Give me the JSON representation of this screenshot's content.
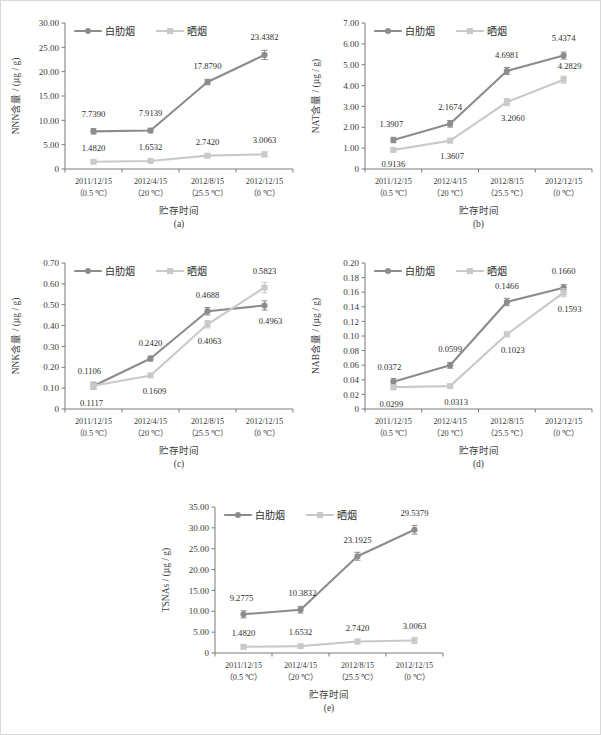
{
  "figure": {
    "series_names": [
      "白肋烟",
      "晒烟"
    ],
    "series_colors": [
      "#8c8c8c",
      "#c9c9c9"
    ],
    "x_axis_title": "贮存时间",
    "x_categories": [
      {
        "date": "2011/12/15",
        "temp": "（0.5 ℃）"
      },
      {
        "date": "2012/4/15",
        "temp": "（20 ℃）"
      },
      {
        "date": "2012/8/15",
        "temp": "（25.5 ℃）"
      },
      {
        "date": "2012/12/15",
        "temp": "（0 ℃）"
      }
    ]
  },
  "chart_data": [
    {
      "type": "line",
      "panel": "(a)",
      "title": "",
      "ylabel": "NNN含量 / (µg / g)",
      "xlabel": "贮存时间",
      "ylim": [
        0,
        30
      ],
      "yticks": [
        "0",
        "5.00",
        "10.00",
        "15.00",
        "20.00",
        "25.00",
        "30.00"
      ],
      "ytick_values": [
        0,
        5,
        10,
        15,
        20,
        25,
        30
      ],
      "grid": false,
      "legend": [
        "白肋烟",
        "晒烟"
      ],
      "legend_position": "top-inside",
      "categories": [
        "2011/12/15（0.5 ℃）",
        "2012/4/15（20 ℃）",
        "2012/8/15（25.5 ℃）",
        "2012/12/15（0 ℃）"
      ],
      "series": [
        {
          "name": "白肋烟",
          "values": [
            7.739,
            7.9139,
            17.879,
            23.4382
          ],
          "errors": [
            0.55,
            0.45,
            0.55,
            0.95
          ],
          "labels": [
            "7.7390",
            "7.9139",
            "17.8790",
            "23.4382"
          ]
        },
        {
          "name": "晒烟",
          "values": [
            1.482,
            1.6532,
            2.742,
            3.0063
          ],
          "errors": [
            0.25,
            0.25,
            0.4,
            0.5
          ],
          "labels": [
            "1.4820",
            "1.6532",
            "2.7420",
            "3.0063"
          ]
        }
      ]
    },
    {
      "type": "line",
      "panel": "(b)",
      "title": "",
      "ylabel": "NAT含量 / (µg / g)",
      "xlabel": "贮存时间",
      "ylim": [
        0,
        7
      ],
      "yticks": [
        "0",
        "1.00",
        "2.00",
        "3.00",
        "4.00",
        "5.00",
        "6.00",
        "7.00"
      ],
      "ytick_values": [
        0,
        1,
        2,
        3,
        4,
        5,
        6,
        7
      ],
      "grid": false,
      "legend": [
        "白肋烟",
        "晒烟"
      ],
      "legend_position": "top-inside",
      "categories": [
        "2011/12/15（0.5 ℃）",
        "2012/4/15（20 ℃）",
        "2012/8/15（25.5 ℃）",
        "2012/12/15（0 ℃）"
      ],
      "series": [
        {
          "name": "白肋烟",
          "values": [
            1.3907,
            2.1674,
            4.6981,
            5.4374
          ],
          "errors": [
            0.13,
            0.16,
            0.17,
            0.17
          ],
          "labels": [
            "1.3907",
            "2.1674",
            "4.6981",
            "5.4374"
          ]
        },
        {
          "name": "晒烟",
          "values": [
            0.9136,
            1.3607,
            3.206,
            4.2829
          ],
          "errors": [
            0.08,
            0.1,
            0.17,
            0.17
          ],
          "labels": [
            "0.9136",
            "1.3607",
            "3.2060",
            "4.2829"
          ]
        }
      ]
    },
    {
      "type": "line",
      "panel": "(c)",
      "title": "",
      "ylabel": "NNK含量 / (µg / g)",
      "xlabel": "贮存时间",
      "ylim": [
        0,
        0.7
      ],
      "yticks": [
        "0",
        "0.10",
        "0.20",
        "0.30",
        "0.40",
        "0.50",
        "0.60",
        "0.70"
      ],
      "ytick_values": [
        0,
        0.1,
        0.2,
        0.3,
        0.4,
        0.5,
        0.6,
        0.7
      ],
      "grid": false,
      "legend": [
        "白肋烟",
        "晒烟"
      ],
      "legend_position": "top-inside",
      "categories": [
        "2011/12/15（0.5 ℃）",
        "2012/4/15（20 ℃）",
        "2012/8/15（25.5 ℃）",
        "2012/12/15（0 ℃）"
      ],
      "series": [
        {
          "name": "白肋烟",
          "values": [
            0.1106,
            0.242,
            0.4688,
            0.4963
          ],
          "errors": [
            0.017,
            0.012,
            0.018,
            0.022
          ],
          "labels": [
            "0.1106",
            "0.2420",
            "0.4688",
            "0.4963"
          ]
        },
        {
          "name": "晒烟",
          "values": [
            0.1117,
            0.1609,
            0.4063,
            0.5823
          ],
          "errors": [
            0.018,
            0.01,
            0.018,
            0.025
          ],
          "labels": [
            "0.1117",
            "0.1609",
            "0.4063",
            "0.5823"
          ]
        }
      ]
    },
    {
      "type": "line",
      "panel": "(d)",
      "title": "",
      "ylabel": "NAB含量 / (µg / g)",
      "xlabel": "贮存时间",
      "ylim": [
        0,
        0.2
      ],
      "yticks": [
        "0",
        "0.02",
        "0.04",
        "0.06",
        "0.08",
        "0.10",
        "0.12",
        "0.14",
        "0.16",
        "0.18",
        "0.20"
      ],
      "ytick_values": [
        0,
        0.02,
        0.04,
        0.06,
        0.08,
        0.1,
        0.12,
        0.14,
        0.16,
        0.18,
        0.2
      ],
      "grid": false,
      "legend": [
        "白肋烟",
        "晒烟"
      ],
      "legend_position": "top-inside",
      "categories": [
        "2011/12/15（0.5 ℃）",
        "2012/4/15（20 ℃）",
        "2012/8/15（25.5 ℃）",
        "2012/12/15（0 ℃）"
      ],
      "series": [
        {
          "name": "白肋烟",
          "values": [
            0.0372,
            0.0599,
            0.1466,
            0.166
          ],
          "errors": [
            0.0045,
            0.004,
            0.005,
            0.0045
          ],
          "labels": [
            "0.0372",
            "0.0599",
            "0.1466",
            "0.1660"
          ]
        },
        {
          "name": "晒烟",
          "values": [
            0.0299,
            0.0313,
            0.1023,
            0.1593
          ],
          "errors": [
            0.0035,
            0.003,
            0.003,
            0.0055
          ],
          "labels": [
            "0.0299",
            "0.0313",
            "0.1023",
            "0.1593"
          ]
        }
      ]
    },
    {
      "type": "line",
      "panel": "(e)",
      "title": "",
      "ylabel": "TSNAs / (µg / g)",
      "xlabel": "贮存时间",
      "ylim": [
        0,
        35
      ],
      "yticks": [
        "0",
        "5.00",
        "10.00",
        "15.00",
        "20.00",
        "25.00",
        "30.00",
        "35.00"
      ],
      "ytick_values": [
        0,
        5,
        10,
        15,
        20,
        25,
        30,
        35
      ],
      "grid": false,
      "legend": [
        "白肋烟",
        "晒烟"
      ],
      "legend_position": "top-inside",
      "categories": [
        "2011/12/15（0.5 ℃）",
        "2012/4/15（20 ℃）",
        "2012/8/15（25.5 ℃）",
        "2012/12/15（0 ℃）"
      ],
      "series": [
        {
          "name": "白肋烟",
          "values": [
            9.2775,
            10.3832,
            23.1925,
            29.5379
          ],
          "errors": [
            0.85,
            0.8,
            0.95,
            1.05
          ],
          "labels": [
            "9.2775",
            "10.3832",
            "23.1925",
            "29.5379"
          ]
        },
        {
          "name": "晒烟",
          "values": [
            1.482,
            1.6532,
            2.742,
            3.0063
          ],
          "errors": [
            0.45,
            0.4,
            0.55,
            0.75
          ],
          "labels": [
            "1.4820",
            "1.6532",
            "2.7420",
            "3.0063"
          ]
        }
      ]
    }
  ]
}
